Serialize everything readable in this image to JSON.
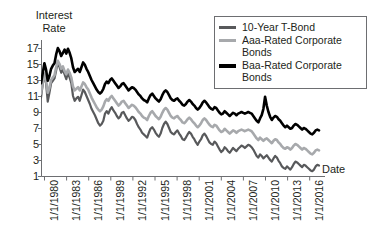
{
  "chart_data": {
    "type": "line",
    "title": "",
    "ylabel": "Interest\nRate",
    "xlabel": "Date",
    "ylim": [
      1,
      18
    ],
    "yticks": [
      1,
      3,
      5,
      7,
      9,
      11,
      13,
      15,
      17
    ],
    "grid": false,
    "legend_position": "top-right",
    "xtick_labels": [
      "1/1/1980",
      "1/1/1983",
      "1/1/1986",
      "1/1/1989",
      "1/1/1992",
      "1/1/1995",
      "1/1/1998",
      "1/1/2001",
      "1/1/2004",
      "1/1/2007",
      "1/1/2010",
      "1/1/2013",
      "1/1/2016"
    ],
    "xlim": [
      1980,
      2018
    ],
    "series": [
      {
        "name": "10-Year T-Bond",
        "color": "#58595b",
        "values": [
          10.8,
          12.4,
          13.7,
          12.6,
          10.3,
          11.4,
          12.6,
          12.9,
          13.2,
          14.2,
          15.3,
          14.6,
          13.9,
          14.3,
          13.7,
          13.1,
          13.9,
          13.3,
          12.6,
          11.0,
          10.4,
          10.7,
          10.9,
          10.4,
          11.1,
          11.8,
          11.5,
          11.0,
          10.5,
          10.0,
          9.4,
          9.0,
          8.6,
          8.1,
          7.6,
          7.3,
          7.5,
          7.9,
          8.8,
          9.1,
          8.8,
          9.3,
          9.6,
          9.2,
          8.9,
          8.5,
          8.2,
          8.4,
          8.9,
          9.0,
          8.6,
          8.2,
          7.9,
          8.1,
          8.4,
          8.3,
          8.0,
          7.5,
          7.1,
          6.8,
          6.4,
          6.2,
          6.0,
          5.8,
          6.4,
          6.9,
          7.1,
          6.8,
          6.4,
          6.1,
          5.9,
          6.3,
          7.0,
          7.5,
          7.8,
          7.5,
          7.0,
          6.5,
          6.3,
          6.2,
          6.5,
          6.7,
          6.3,
          6.0,
          5.6,
          5.5,
          5.8,
          6.2,
          6.5,
          6.3,
          5.9,
          5.6,
          5.2,
          4.9,
          5.3,
          5.6,
          6.1,
          6.3,
          6.0,
          5.6,
          5.2,
          5.0,
          4.9,
          5.3,
          5.1,
          4.7,
          4.3,
          4.0,
          4.2,
          4.6,
          4.4,
          4.1,
          3.9,
          4.2,
          4.5,
          4.3,
          4.1,
          4.4,
          4.6,
          4.8,
          4.7,
          4.5,
          4.7,
          4.9,
          4.8,
          4.6,
          4.3,
          3.9,
          3.5,
          3.3,
          3.7,
          3.5,
          3.2,
          3.4,
          3.6,
          3.3,
          3.0,
          2.8,
          3.2,
          3.5,
          3.3,
          2.9,
          2.6,
          2.2,
          2.0,
          1.9,
          2.2,
          2.0,
          1.8,
          2.1,
          2.5,
          2.8,
          2.7,
          2.5,
          2.3,
          2.1,
          2.4,
          2.3,
          2.1,
          1.9,
          1.7,
          1.6,
          1.8,
          2.2,
          2.4,
          2.3
        ]
      },
      {
        "name": "Aaa-Rated Corporate Bonds",
        "color": "#a7a9ac",
        "values": [
          11.3,
          12.6,
          13.8,
          13.0,
          11.4,
          12.0,
          13.0,
          13.3,
          13.6,
          14.6,
          15.4,
          15.0,
          14.4,
          14.7,
          14.1,
          13.7,
          14.3,
          13.9,
          13.3,
          12.2,
          11.7,
          11.9,
          12.1,
          11.7,
          12.2,
          12.7,
          12.5,
          12.1,
          11.8,
          11.3,
          10.8,
          10.4,
          10.0,
          9.6,
          9.3,
          9.1,
          9.3,
          9.7,
          10.3,
          10.6,
          10.4,
          10.8,
          11.0,
          10.7,
          10.4,
          10.1,
          9.8,
          10.0,
          10.3,
          10.4,
          10.1,
          9.8,
          9.5,
          9.7,
          9.9,
          9.8,
          9.6,
          9.3,
          9.0,
          8.8,
          8.5,
          8.3,
          8.2,
          8.0,
          8.5,
          8.9,
          9.1,
          8.8,
          8.5,
          8.3,
          8.1,
          8.4,
          8.9,
          9.3,
          9.5,
          9.3,
          8.9,
          8.5,
          8.3,
          8.2,
          8.4,
          8.5,
          8.2,
          8.0,
          7.7,
          7.6,
          7.8,
          8.1,
          8.3,
          8.1,
          7.8,
          7.6,
          7.3,
          7.1,
          7.3,
          7.6,
          8.0,
          8.2,
          8.0,
          7.7,
          7.4,
          7.2,
          7.1,
          7.4,
          7.3,
          7.0,
          6.7,
          6.5,
          6.6,
          6.9,
          6.7,
          6.5,
          6.3,
          6.5,
          6.7,
          6.6,
          6.4,
          6.6,
          6.7,
          6.8,
          6.7,
          6.6,
          6.7,
          6.8,
          6.7,
          6.6,
          6.3,
          6.0,
          5.7,
          5.5,
          5.8,
          5.6,
          5.4,
          5.6,
          5.7,
          5.5,
          5.3,
          5.1,
          5.4,
          5.6,
          5.5,
          5.2,
          5.0,
          4.7,
          4.5,
          4.4,
          4.6,
          4.5,
          4.3,
          4.5,
          4.8,
          5.0,
          4.9,
          4.7,
          4.5,
          4.3,
          4.5,
          4.4,
          4.2,
          4.0,
          3.8,
          3.7,
          3.9,
          4.2,
          4.3,
          4.2
        ]
      },
      {
        "name": "Baa-Rated Corporate Bonds",
        "color": "#000000",
        "values": [
          12.6,
          13.8,
          15.1,
          14.3,
          12.9,
          13.5,
          14.4,
          14.8,
          15.1,
          16.2,
          17.0,
          16.6,
          16.0,
          16.4,
          16.8,
          16.3,
          16.9,
          16.4,
          15.7,
          14.6,
          14.0,
          14.2,
          14.4,
          14.0,
          14.6,
          15.2,
          14.9,
          14.4,
          14.0,
          13.5,
          13.0,
          12.6,
          12.2,
          11.8,
          11.5,
          11.3,
          11.5,
          11.9,
          12.5,
          12.8,
          12.6,
          13.0,
          13.2,
          12.9,
          12.6,
          12.3,
          12.0,
          12.2,
          12.5,
          12.6,
          12.3,
          12.0,
          11.7,
          11.9,
          12.1,
          12.0,
          11.8,
          11.5,
          11.2,
          11.0,
          10.7,
          10.5,
          10.4,
          10.2,
          10.7,
          11.1,
          11.3,
          11.0,
          10.7,
          10.5,
          10.3,
          10.6,
          11.1,
          11.5,
          11.7,
          11.5,
          11.1,
          10.7,
          10.5,
          10.4,
          10.6,
          10.7,
          10.4,
          10.2,
          9.9,
          9.8,
          10.0,
          10.3,
          10.5,
          10.3,
          10.0,
          9.8,
          9.5,
          9.3,
          9.5,
          9.8,
          10.2,
          10.4,
          10.2,
          9.9,
          9.6,
          9.4,
          9.3,
          9.6,
          9.5,
          9.2,
          8.9,
          8.7,
          8.8,
          9.1,
          8.9,
          8.7,
          8.5,
          8.7,
          8.9,
          8.8,
          8.6,
          8.8,
          8.9,
          9.0,
          8.9,
          8.8,
          8.9,
          9.0,
          8.9,
          8.8,
          8.5,
          8.2,
          7.9,
          7.7,
          8.2,
          8.6,
          9.4,
          10.9,
          9.8,
          9.0,
          8.4,
          8.0,
          8.3,
          8.5,
          8.4,
          8.1,
          7.9,
          7.6,
          7.3,
          7.1,
          7.3,
          7.1,
          6.9,
          7.0,
          7.3,
          7.5,
          7.4,
          7.2,
          7.0,
          6.8,
          7.0,
          6.9,
          6.7,
          6.5,
          6.3,
          6.2,
          6.4,
          6.7,
          6.8,
          6.7
        ]
      }
    ]
  },
  "legend": {
    "items": [
      {
        "label": "10-Year T-Bond",
        "color": "#58595b"
      },
      {
        "label": "Aaa-Rated Corporate Bonds",
        "color": "#a7a9ac"
      },
      {
        "label": "Baa-Rated Corporate Bonds",
        "color": "#000000"
      }
    ]
  },
  "axes": {
    "y_title": "Interest\nRate",
    "x_title": "Date"
  }
}
